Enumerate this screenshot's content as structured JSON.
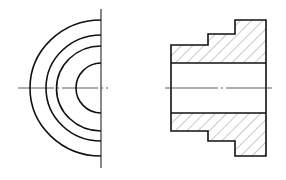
{
  "drawing": {
    "title": "Stepped bushing — half end view and full section",
    "views": [
      {
        "name": "half-end-view",
        "ring_count": 4
      },
      {
        "name": "section-view",
        "hatch": "diagonal 45deg",
        "steps": 3,
        "bore": "through"
      }
    ],
    "colors": {
      "line": "#111111",
      "background": "#ffffff",
      "hatch": "#444444"
    }
  }
}
